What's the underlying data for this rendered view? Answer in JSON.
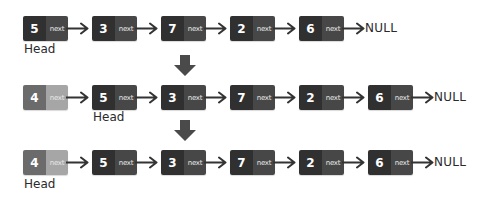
{
  "diagram": {
    "pointer_label": "next",
    "null_label": "NULL",
    "head_label": "Head",
    "colors": {
      "node_value": "#303030",
      "node_pointer": "#474747",
      "new_node_value": "#6b6b6b",
      "new_node_pointer": "#a6a6a6",
      "arrow": "#333333"
    },
    "rows": [
      {
        "step": "original list",
        "nodes": [
          {
            "value": "5",
            "pointer": "next",
            "style": "dark"
          },
          {
            "value": "3",
            "pointer": "next",
            "style": "dark"
          },
          {
            "value": "7",
            "pointer": "next",
            "style": "dark"
          },
          {
            "value": "2",
            "pointer": "next",
            "style": "dark"
          },
          {
            "value": "6",
            "pointer": "next",
            "style": "dark"
          }
        ],
        "head_index": 0,
        "terminator": "NULL"
      },
      {
        "step": "new node linked to head",
        "nodes": [
          {
            "value": "4",
            "pointer": "next",
            "style": "light"
          },
          {
            "value": "5",
            "pointer": "next",
            "style": "dark"
          },
          {
            "value": "3",
            "pointer": "next",
            "style": "dark"
          },
          {
            "value": "7",
            "pointer": "next",
            "style": "dark"
          },
          {
            "value": "2",
            "pointer": "next",
            "style": "dark"
          },
          {
            "value": "6",
            "pointer": "next",
            "style": "dark"
          }
        ],
        "head_index": 1,
        "terminator": "NULL"
      },
      {
        "step": "head moved to new node",
        "nodes": [
          {
            "value": "4",
            "pointer": "next",
            "style": "light"
          },
          {
            "value": "5",
            "pointer": "next",
            "style": "dark"
          },
          {
            "value": "3",
            "pointer": "next",
            "style": "dark"
          },
          {
            "value": "7",
            "pointer": "next",
            "style": "dark"
          },
          {
            "value": "2",
            "pointer": "next",
            "style": "dark"
          },
          {
            "value": "6",
            "pointer": "next",
            "style": "dark"
          }
        ],
        "head_index": 0,
        "terminator": "NULL"
      }
    ]
  }
}
